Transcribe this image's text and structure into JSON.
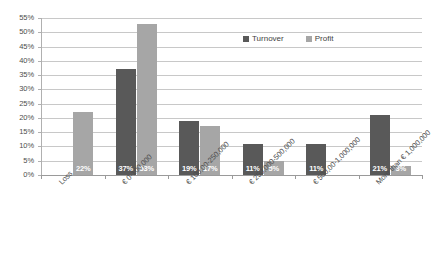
{
  "chart_data": {
    "type": "bar",
    "title": "",
    "subtitle": "",
    "xlabel": "",
    "ylabel": "",
    "ylim": [
      0,
      55
    ],
    "ytick_values": [
      0,
      5,
      10,
      15,
      20,
      25,
      30,
      35,
      40,
      45,
      50,
      55
    ],
    "ytick_labels": [
      "0%",
      "5%",
      "10%",
      "15%",
      "20%",
      "25%",
      "30%",
      "35%",
      "40%",
      "45%",
      "50%",
      "55%"
    ],
    "grid": true,
    "legend_position": "top-right",
    "value_format": "percent",
    "categories": [
      "Loss",
      "€ 0-100,000",
      "€ 100,00-250,000",
      "€ 250,000-500,000",
      "€ 500,00-1,000,000",
      "More than € 1,000,000"
    ],
    "series": [
      {
        "name": "Turnover",
        "color": "#595959",
        "values": [
          null,
          37,
          19,
          11,
          11,
          21
        ],
        "labels": [
          "",
          "37%",
          "19%",
          "11%",
          "11%",
          "21%"
        ]
      },
      {
        "name": "Profit",
        "color": "#a6a6a6",
        "values": [
          22,
          53,
          17,
          5,
          null,
          3
        ],
        "labels": [
          "22%",
          "53%",
          "17%",
          "5%",
          "",
          "3%"
        ]
      }
    ]
  },
  "legend": {
    "items": [
      {
        "label": "Turnover",
        "color": "#595959"
      },
      {
        "label": "Profit",
        "color": "#a6a6a6"
      }
    ]
  },
  "axes": {
    "y": {
      "ticks": [
        "55%",
        "50%",
        "45%",
        "40%",
        "35%",
        "30%",
        "25%",
        "20%",
        "15%",
        "10%",
        "5%",
        "0%"
      ]
    },
    "x": {
      "categories": [
        "Loss",
        "€ 0-100,000",
        "€ 100,00-250,000",
        "€ 250,000-500,000",
        "€ 500,00-1,000,000",
        "More than € 1,000,000"
      ]
    }
  },
  "colors": {
    "turnover": "#595959",
    "profit": "#a6a6a6",
    "gridline": "#c8c8c8",
    "axis": "#9a9a9a",
    "text": "#4d4d4d",
    "background": "#ffffff"
  }
}
